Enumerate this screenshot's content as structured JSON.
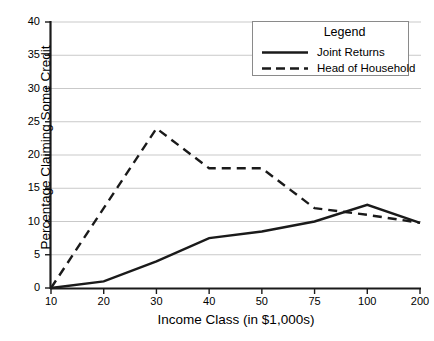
{
  "chart_data": {
    "type": "line",
    "title": "",
    "xlabel": "Income Class (in $1,000s)",
    "ylabel": "Percentage Claiming Some Credit",
    "categories": [
      "10",
      "20",
      "30",
      "40",
      "50",
      "75",
      "100",
      "200"
    ],
    "ytick_labels": [
      "0",
      "5",
      "10",
      "15",
      "20",
      "25",
      "30",
      "35",
      "40"
    ],
    "ylim": [
      0,
      40
    ],
    "ystep": 5,
    "grid": "horizontal",
    "legend_position": "top-right",
    "legend_title": "Legend",
    "series": [
      {
        "name": "Joint Returns",
        "style": "solid",
        "color": "#1a1a1a",
        "values": [
          0,
          1,
          4,
          7.5,
          8.5,
          10,
          12.5,
          9.8
        ]
      },
      {
        "name": "Head of Household",
        "style": "dashed",
        "color": "#1a1a1a",
        "values": [
          0,
          12,
          24,
          18,
          18,
          12,
          11,
          9.8
        ]
      }
    ]
  },
  "legend": {
    "title": "Legend",
    "entries": [
      {
        "label": "Joint Returns",
        "style": "solid"
      },
      {
        "label": "Head of Household",
        "style": "dashed"
      }
    ]
  },
  "axes": {
    "x_title": "Income Class (in $1,000s)",
    "y_title": "Percentage Claiming Some Credit"
  }
}
